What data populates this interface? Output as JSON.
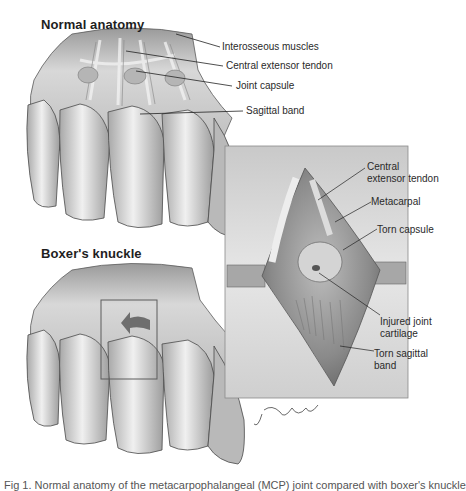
{
  "figure": {
    "panels": [
      {
        "id": "normal",
        "heading": "Normal anatomy",
        "labels": [
          "Interosseous muscles",
          "Central extensor tendon",
          "Joint capsule",
          "Sagittal band"
        ]
      },
      {
        "id": "boxer",
        "heading": "Boxer's knuckle"
      },
      {
        "id": "inset",
        "labels": [
          "Central\nextensor tendon",
          "Metacarpal",
          "Torn capsule",
          "Injured joint\ncartilage",
          "Torn sagittal\nband"
        ]
      }
    ],
    "signature": "J Gregory '09",
    "caption": "Fig 1. Normal anatomy of the metacarpophalangeal (MCP) joint compared with boxer's knuckle"
  },
  "labels": {
    "normal_heading": "Normal anatomy",
    "boxer_heading": "Boxer's knuckle",
    "interosseous": "Interosseous muscles",
    "central_extensor": "Central extensor tendon",
    "joint_capsule": "Joint capsule",
    "sagittal_band": "Sagittal band",
    "inset_central_1": "Central",
    "inset_central_2": "extensor tendon",
    "metacarpal": "Metacarpal",
    "torn_capsule": "Torn capsule",
    "injured_1": "Injured joint",
    "injured_2": "cartilage",
    "torn_sagittal_1": "Torn sagittal",
    "torn_sagittal_2": "band",
    "signature": "J Gregory '09"
  },
  "colors": {
    "background": "#ffffff",
    "skin_light": "#e8e8e8",
    "skin_mid": "#c4c4c4",
    "skin_dark": "#8e8e8e",
    "outline": "#4a4a4a",
    "text": "#2a2a2a",
    "inset_bg": "#d6d6d6"
  }
}
